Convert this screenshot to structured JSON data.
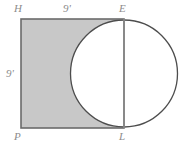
{
  "figure": {
    "type": "geometry-diagram",
    "background_color": "#ffffff",
    "shaded_color": "#c8c8c8",
    "unshaded_color": "#ffffff",
    "stroke_color": "#4d4d4d",
    "label_color": "#8c8c8c",
    "vertices": [
      {
        "id": "vertex-h",
        "label": "H",
        "position": "top-left",
        "x": 21,
        "y": 19
      },
      {
        "id": "vertex-e",
        "label": "E",
        "position": "top-right",
        "x": 124,
        "y": 19
      },
      {
        "id": "vertex-l",
        "label": "L",
        "position": "bottom-right",
        "x": 124,
        "y": 128
      },
      {
        "id": "vertex-p",
        "label": "P",
        "position": "bottom-left",
        "x": 21,
        "y": 128
      }
    ],
    "dimensions": [
      {
        "id": "dim-top",
        "label": "9'",
        "edge": "HE",
        "value": 9,
        "unit": "feet"
      },
      {
        "id": "dim-left",
        "label": "9'",
        "edge": "HP",
        "value": 9,
        "unit": "feet"
      }
    ],
    "rectangle": {
      "x": 21,
      "y": 19,
      "width": 103,
      "height": 109
    },
    "circle": {
      "cx": 124,
      "cy": 73.5,
      "r": 53.5,
      "diameter_equals": "EL"
    },
    "segment_EL": {
      "x1": 124,
      "y1": 19,
      "x2": 124,
      "y2": 128
    }
  }
}
